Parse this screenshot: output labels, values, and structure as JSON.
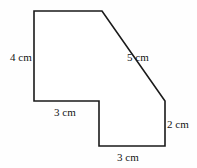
{
  "figure": {
    "background_color": "#fefefe",
    "stroke_color": "#1a1a1a",
    "stroke_width": 1.6,
    "units": "cm",
    "vertices": [
      {
        "name": "top-left",
        "x": 34,
        "y": 11
      },
      {
        "name": "top-right",
        "x": 102,
        "y": 11
      },
      {
        "name": "diagonal-end",
        "x": 165,
        "y": 101
      },
      {
        "name": "bottom-right",
        "x": 165,
        "y": 146
      },
      {
        "name": "bottom-left",
        "x": 99,
        "y": 146
      },
      {
        "name": "notch-inner-corner",
        "x": 99,
        "y": 101
      },
      {
        "name": "left-bottom",
        "x": 34,
        "y": 101
      }
    ],
    "labels": {
      "left_side": "4 cm",
      "hypotenuse": "5 cm",
      "middle_horizontal": "3 cm",
      "right_side": "2 cm",
      "bottom_horizontal": "3 cm"
    }
  }
}
